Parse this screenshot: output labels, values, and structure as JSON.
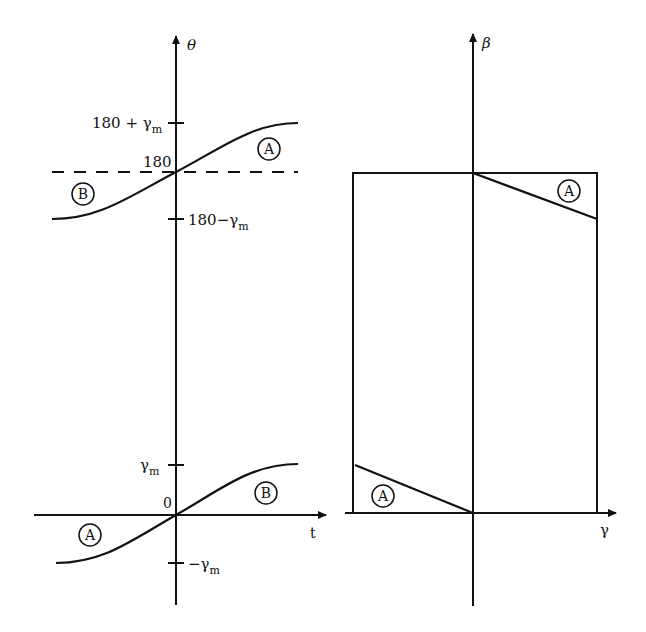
{
  "left_panel": {
    "y_axis_label": "θ",
    "x_axis_label": "t",
    "ticks": {
      "upper_high": {
        "base": "180 + γ",
        "sub": "m"
      },
      "upper_mid": "180",
      "upper_low": {
        "base": "180−γ",
        "sub": "m"
      },
      "lower_high": {
        "base": "γ",
        "sub": "m"
      },
      "origin": "0",
      "lower_low": {
        "base": "−γ",
        "sub": "m"
      }
    },
    "region_labels": {
      "upper_right": "A",
      "upper_left": "B",
      "lower_right": "B",
      "lower_left": "A"
    }
  },
  "right_panel": {
    "y_axis_label": "β",
    "x_axis_label": "γ",
    "region_labels": {
      "upper_right": "A",
      "lower_left": "A"
    }
  },
  "colors": {
    "ink": "#111111",
    "background": "#ffffff"
  }
}
